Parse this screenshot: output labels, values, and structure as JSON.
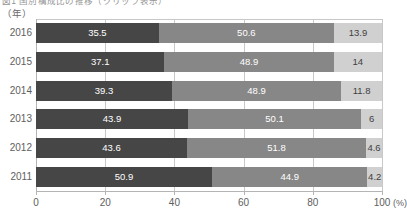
{
  "title": {
    "text": "図1  国別構成比の推移（クリップ表示）",
    "visible_partial": true
  },
  "axis_unit_label": "（年）",
  "x_unit_label": "(%)",
  "colors": {
    "segment_1": "#464646",
    "segment_2": "#878787",
    "segment_3": "#d0d0d0",
    "grid": "#c8c8c8",
    "axis": "#b4b4b4",
    "text": "#5e5e5e"
  },
  "chart_data": {
    "type": "bar",
    "orientation": "horizontal",
    "stacked": true,
    "normalized_percent": true,
    "title": "図1  国別構成比の推移（クリップ表示）",
    "xlabel": "(%)",
    "ylabel": "（年）",
    "xlim": [
      0,
      100
    ],
    "xticks": [
      0,
      20,
      40,
      60,
      80,
      100
    ],
    "xticklabels": [
      "0",
      "20",
      "40",
      "60",
      "80",
      "100"
    ],
    "grid": true,
    "grid_axis": "x",
    "legend": null,
    "categories": [
      "2016",
      "2015",
      "2014",
      "2013",
      "2012",
      "2011"
    ],
    "series": [
      {
        "name": "segment-1",
        "color": "#464646",
        "values": [
          35.5,
          37.1,
          39.3,
          43.9,
          43.6,
          50.9
        ]
      },
      {
        "name": "segment-2",
        "color": "#878787",
        "values": [
          50.6,
          48.9,
          48.9,
          50.1,
          51.8,
          44.9
        ]
      },
      {
        "name": "segment-3",
        "color": "#d0d0d0",
        "values": [
          13.9,
          14,
          11.8,
          6,
          4.6,
          4.2
        ]
      }
    ],
    "rows": [
      {
        "category": "2016",
        "values": [
          35.5,
          50.6,
          13.9
        ],
        "labels": [
          "35.5",
          "50.6",
          "13.9"
        ]
      },
      {
        "category": "2015",
        "values": [
          37.1,
          48.9,
          14
        ],
        "labels": [
          "37.1",
          "48.9",
          "14"
        ]
      },
      {
        "category": "2014",
        "values": [
          39.3,
          48.9,
          11.8
        ],
        "labels": [
          "39.3",
          "48.9",
          "11.8"
        ]
      },
      {
        "category": "2013",
        "values": [
          43.9,
          50.1,
          6
        ],
        "labels": [
          "43.9",
          "50.1",
          "6"
        ]
      },
      {
        "category": "2012",
        "values": [
          43.6,
          51.8,
          4.6
        ],
        "labels": [
          "43.6",
          "51.8",
          "4.6"
        ]
      },
      {
        "category": "2011",
        "values": [
          50.9,
          44.9,
          4.2
        ],
        "labels": [
          "50.9",
          "44.9",
          "4.2"
        ]
      }
    ]
  }
}
